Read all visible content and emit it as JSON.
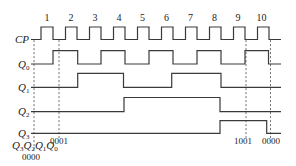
{
  "diagram": {
    "type": "timing-diagram",
    "signals": [
      {
        "name": "CP",
        "label": "CP",
        "sub": ""
      },
      {
        "name": "Q0",
        "label": "Q",
        "sub": "0"
      },
      {
        "name": "Q1",
        "label": "Q",
        "sub": "1"
      },
      {
        "name": "Q2",
        "label": "Q",
        "sub": "2"
      },
      {
        "name": "Q3",
        "label": "Q",
        "sub": "3"
      }
    ],
    "pulse_numbers": [
      "1",
      "2",
      "3",
      "4",
      "5",
      "6",
      "7",
      "8",
      "9",
      "10"
    ],
    "state_header": {
      "text": "Q3Q2Q1Q0",
      "parts": [
        {
          "l": "Q",
          "s": "3"
        },
        {
          "l": "Q",
          "s": "2"
        },
        {
          "l": "Q",
          "s": "1"
        },
        {
          "l": "Q",
          "s": "0"
        }
      ]
    },
    "state_codes": {
      "initial": "0000",
      "after_pulse_1": "0001",
      "after_pulse_9": "1001",
      "after_pulse_10": "0000"
    },
    "waveforms": {
      "CP": "pulses 1-10, rising edges every cycle",
      "Q0": [
        0,
        1,
        0,
        1,
        0,
        1,
        0,
        1,
        0,
        1,
        0
      ],
      "Q1": [
        0,
        0,
        1,
        1,
        0,
        0,
        1,
        1,
        0,
        0,
        0
      ],
      "Q2": [
        0,
        0,
        0,
        0,
        1,
        1,
        1,
        1,
        0,
        0,
        0
      ],
      "Q3": [
        0,
        0,
        0,
        0,
        0,
        0,
        0,
        0,
        1,
        1,
        0
      ]
    },
    "colors": {
      "stroke": "#3a3a3a",
      "text": "#222222",
      "background": "#ffffff"
    }
  }
}
